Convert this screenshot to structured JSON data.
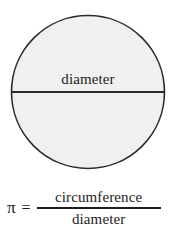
{
  "figure": {
    "name": "pi-definition-diagram",
    "caption_alt": "A shaded circle with a horizontal diameter line labeled diameter, above the formula pi equals circumference over diameter."
  },
  "diagram": {
    "shape": "circle",
    "shape_icon": "circle-icon",
    "diameter_line_icon": "horizontal-line-icon",
    "diameter_label": "diameter",
    "geometry": {
      "center_x": 88,
      "center_y": 92,
      "radius": 77,
      "diameter_px": 154,
      "diameter_line_y": 92
    },
    "colors": {
      "fill": "#f0f0f0",
      "stroke": "#2a2a2a",
      "line": "#2a2a2a",
      "text": "#1d1d1d",
      "background": "#ffffff"
    }
  },
  "equation": {
    "pi_symbol": "π",
    "equals_symbol": "=",
    "numerator": "circumference",
    "denominator": "diameter"
  }
}
